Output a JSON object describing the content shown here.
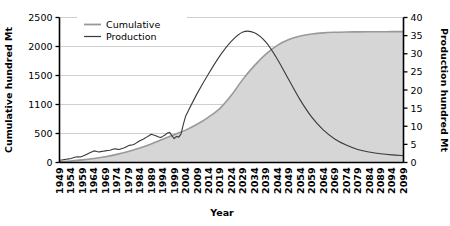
{
  "chart_data": {
    "type": "line",
    "title": "",
    "xlabel": "Year",
    "ylabel": "Cumulative hundred Mt",
    "y2label": "Production hundred Mt",
    "grid": true,
    "legend_position": "top-left",
    "xlim": [
      1949,
      2099
    ],
    "xticks": [
      1949,
      1954,
      1959,
      1964,
      1969,
      1974,
      1979,
      1984,
      1989,
      1994,
      1999,
      2004,
      2009,
      2014,
      2019,
      2024,
      2029,
      2034,
      2039,
      2044,
      2049,
      2054,
      2059,
      2064,
      2069,
      2074,
      2079,
      2084,
      2089,
      2094,
      2099
    ],
    "yticks_left": [
      0,
      500,
      1100,
      1500,
      2000,
      2500
    ],
    "yticks_right": [
      0,
      5,
      10,
      15,
      20,
      25,
      30,
      35,
      40
    ],
    "ylim_left": [
      0,
      2500
    ],
    "ylim_right": [
      0,
      40
    ],
    "colors": {
      "cumulative_line": "#999999",
      "cumulative_fill": "#d6d6d6",
      "production_line": "#333333",
      "grid": "#c9c9c9",
      "axis": "#000000"
    },
    "series": [
      {
        "name": "Cumulative",
        "axis": "left",
        "style": "area",
        "x": [
          1949,
          1954,
          1959,
          1964,
          1969,
          1974,
          1979,
          1984,
          1989,
          1994,
          1999,
          2004,
          2009,
          2014,
          2019,
          2024,
          2029,
          2034,
          2039,
          2044,
          2049,
          2054,
          2059,
          2064,
          2069,
          2074,
          2079,
          2084,
          2089,
          2094,
          2099
        ],
        "values": [
          10,
          25,
          45,
          70,
          100,
          140,
          190,
          250,
          320,
          400,
          480,
          570,
          690,
          840,
          1020,
          1230,
          1450,
          1670,
          1870,
          2020,
          2120,
          2180,
          2215,
          2235,
          2245,
          2250,
          2252,
          2254,
          2255,
          2256,
          2257
        ]
      },
      {
        "name": "Production",
        "axis": "right",
        "style": "line",
        "x": [
          1949,
          1950,
          1951,
          1952,
          1953,
          1954,
          1955,
          1956,
          1957,
          1958,
          1959,
          1960,
          1961,
          1962,
          1963,
          1964,
          1965,
          1966,
          1967,
          1968,
          1969,
          1970,
          1971,
          1972,
          1973,
          1974,
          1975,
          1976,
          1977,
          1978,
          1979,
          1980,
          1981,
          1982,
          1983,
          1984,
          1985,
          1986,
          1987,
          1988,
          1989,
          1990,
          1991,
          1992,
          1993,
          1994,
          1995,
          1996,
          1997,
          1998,
          1999,
          2000,
          2001,
          2002,
          2003,
          2004,
          2009,
          2014,
          2019,
          2024,
          2029,
          2034,
          2039,
          2044,
          2049,
          2054,
          2059,
          2064,
          2069,
          2074,
          2079,
          2084,
          2089,
          2094,
          2099
        ],
        "values": [
          0.6,
          0.7,
          0.8,
          0.9,
          1.0,
          1.1,
          1.3,
          1.5,
          1.6,
          1.5,
          1.7,
          2.0,
          2.3,
          2.6,
          2.9,
          3.2,
          3.1,
          2.9,
          3.0,
          3.1,
          3.2,
          3.3,
          3.4,
          3.6,
          3.8,
          3.7,
          3.6,
          3.8,
          4.0,
          4.3,
          4.6,
          4.8,
          4.9,
          5.2,
          5.6,
          6.0,
          6.3,
          6.6,
          7.0,
          7.4,
          7.8,
          7.6,
          7.4,
          7.1,
          6.9,
          7.2,
          7.6,
          8.1,
          8.3,
          7.4,
          6.6,
          7.2,
          7.0,
          7.9,
          10.5,
          12.8,
          19.0,
          24.5,
          29.5,
          33.5,
          36.0,
          35.8,
          33.2,
          28.5,
          22.8,
          17.2,
          12.5,
          9.0,
          6.5,
          4.8,
          3.6,
          2.9,
          2.4,
          2.1,
          1.9
        ]
      }
    ]
  },
  "legend": {
    "items": [
      {
        "label": "Cumulative",
        "color": "#999999"
      },
      {
        "label": "Production",
        "color": "#333333"
      }
    ]
  }
}
